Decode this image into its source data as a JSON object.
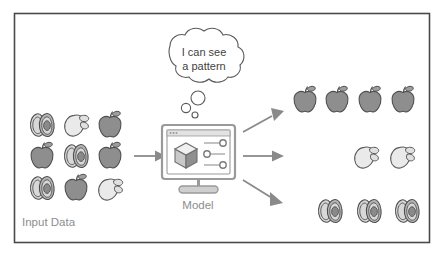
{
  "figure": {
    "type": "machine-learning-classification-diagram",
    "background_color": "#ffffff",
    "frame_border_color": "#4a4a4a"
  },
  "labels": {
    "input_data": "Input Data",
    "model": "Model"
  },
  "thought_bubble": {
    "line1": "I can see",
    "line2": "a pattern",
    "tail_circle_count": 3
  },
  "input_grid": {
    "rows": 3,
    "columns": 3,
    "items": [
      [
        "avocado",
        "mango",
        "apple"
      ],
      [
        "apple",
        "avocado",
        "apple"
      ],
      [
        "avocado",
        "apple",
        "mango"
      ]
    ]
  },
  "model_device": {
    "icon": "desktop-monitor",
    "screen_contents": {
      "cube_icon": "3d-cube",
      "slider_count": 3,
      "slider_knob_positions": [
        "right",
        "left",
        "right"
      ],
      "titlebar_dot_count": 3
    }
  },
  "arrows": {
    "input_to_model": "right",
    "outputs": [
      {
        "direction": "up-right",
        "target": "apple-row"
      },
      {
        "direction": "right",
        "target": "mango-row"
      },
      {
        "direction": "down-right",
        "target": "avocado-row"
      }
    ]
  },
  "output_groups": [
    {
      "category": "apple",
      "count": 4
    },
    {
      "category": "mango",
      "count": 2
    },
    {
      "category": "avocado",
      "count": 3
    }
  ],
  "colors": {
    "apple": "#8e8e8e",
    "mango": "#eaeaea",
    "avocado_light": "#d6d6d6",
    "avocado_dark": "#b4b4b4",
    "outline": "#4f4f4f",
    "label_text": "#8d8d8d",
    "bubble_text": "#3f3f3f",
    "arrow": "#8a8a8a"
  }
}
